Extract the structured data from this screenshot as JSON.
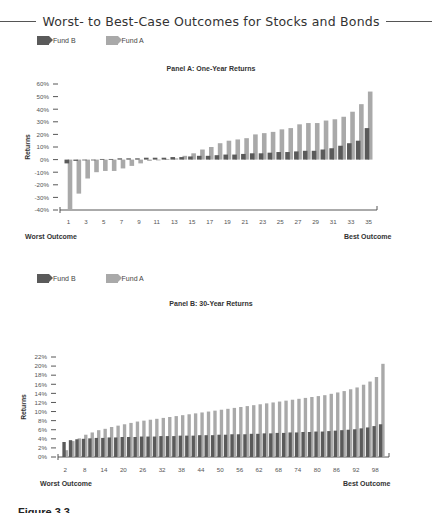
{
  "figure": {
    "title": "Worst- to Best-Case Outcomes for Stocks and Bonds",
    "caption_partial": "Figure 3.3"
  },
  "colors": {
    "fund_b": "#5a5a5a",
    "fund_a": "#a9a9a9",
    "axis": "#444444"
  },
  "chart_data": [
    {
      "type": "bar",
      "title": "Panel A: One-Year Returns",
      "xlabel_left": "Worst Outcome",
      "xlabel_right": "Best Outcome",
      "ylabel": "Returns",
      "ylim": [
        -40,
        60
      ],
      "yticks": [
        "60%",
        "50%",
        "40%",
        "30%",
        "20%",
        "10%",
        "0%",
        "-10%",
        "-20%",
        "-30%",
        "-40%"
      ],
      "xtick_labels": [
        "1",
        "3",
        "5",
        "7",
        "9",
        "11",
        "13",
        "15",
        "17",
        "19",
        "21",
        "23",
        "25",
        "27",
        "29",
        "31",
        "33",
        "35"
      ],
      "legend": [
        "Fund B",
        "Fund A"
      ],
      "grid": false,
      "x": [
        1,
        2,
        3,
        4,
        5,
        6,
        7,
        8,
        9,
        10,
        11,
        12,
        13,
        14,
        15,
        16,
        17,
        18,
        19,
        20,
        21,
        22,
        23,
        24,
        25,
        26,
        27,
        28,
        29,
        30,
        31,
        32,
        33,
        34,
        35
      ],
      "series": [
        {
          "name": "Fund B",
          "values": [
            -3,
            -1,
            -0.5,
            0,
            0.5,
            0.5,
            1,
            1,
            1,
            1.5,
            1.5,
            1.5,
            2,
            2,
            2.5,
            3,
            3,
            3.5,
            4,
            4,
            4.5,
            5,
            5,
            5.5,
            6,
            6,
            6.5,
            7,
            7,
            8,
            9,
            11,
            13,
            15,
            25
          ]
        },
        {
          "name": "Fund A",
          "values": [
            -40,
            -27,
            -15,
            -10,
            -9,
            -9,
            -7,
            -5,
            -3,
            -1,
            0,
            0.5,
            1,
            3,
            5,
            8,
            10,
            13,
            15,
            16,
            17,
            20,
            21,
            22,
            24,
            25,
            28,
            29,
            29,
            31,
            32,
            34,
            38,
            44,
            54
          ]
        }
      ]
    },
    {
      "type": "bar",
      "title": "Panel B: 30-Year Returns",
      "xlabel_left": "Worst Outcome",
      "xlabel_right": "Best Outcome",
      "ylabel": "Returns",
      "ylim": [
        0,
        22
      ],
      "yticks": [
        "22%",
        "20%",
        "18%",
        "16%",
        "14%",
        "12%",
        "10%",
        "8%",
        "6%",
        "4%",
        "2%",
        "0%"
      ],
      "xtick_labels": [
        "2",
        "8",
        "14",
        "20",
        "26",
        "32",
        "38",
        "44",
        "50",
        "56",
        "62",
        "68",
        "74",
        "80",
        "86",
        "92",
        "98"
      ],
      "legend": [
        "Fund B",
        "Fund A"
      ],
      "grid": false,
      "x": [
        1,
        2,
        3,
        4,
        5,
        6,
        7,
        8,
        9,
        10,
        11,
        12,
        13,
        14,
        15,
        16,
        17,
        18,
        19,
        20,
        21,
        22,
        23,
        24,
        25,
        26,
        27,
        28,
        29,
        30,
        31,
        32,
        33,
        34,
        35,
        36,
        37,
        38,
        39,
        40,
        41,
        42,
        43,
        44,
        45,
        46,
        47,
        48,
        49,
        50
      ],
      "series": [
        {
          "name": "Fund B",
          "values": [
            3.3,
            3.7,
            3.9,
            4.0,
            4.1,
            4.2,
            4.2,
            4.3,
            4.3,
            4.4,
            4.4,
            4.4,
            4.5,
            4.5,
            4.5,
            4.6,
            4.6,
            4.6,
            4.7,
            4.7,
            4.7,
            4.8,
            4.8,
            4.8,
            4.9,
            4.9,
            5.0,
            5.0,
            5.0,
            5.1,
            5.1,
            5.2,
            5.2,
            5.3,
            5.3,
            5.4,
            5.4,
            5.5,
            5.5,
            5.6,
            5.6,
            5.7,
            5.8,
            5.9,
            6.0,
            6.1,
            6.3,
            6.5,
            6.8,
            7.2
          ]
        },
        {
          "name": "Fund A",
          "values": [
            1.5,
            3.5,
            4.1,
            4.9,
            5.4,
            5.9,
            6.2,
            6.6,
            6.9,
            7.2,
            7.5,
            7.8,
            8.0,
            8.2,
            8.4,
            8.6,
            8.8,
            9.0,
            9.2,
            9.4,
            9.6,
            9.8,
            10.0,
            10.2,
            10.4,
            10.6,
            10.8,
            11.0,
            11.2,
            11.4,
            11.6,
            11.8,
            12.0,
            12.2,
            12.4,
            12.6,
            12.8,
            13.0,
            13.2,
            13.4,
            13.6,
            13.9,
            14.2,
            14.5,
            14.9,
            15.3,
            15.9,
            16.6,
            17.6,
            20.5
          ]
        }
      ]
    }
  ]
}
